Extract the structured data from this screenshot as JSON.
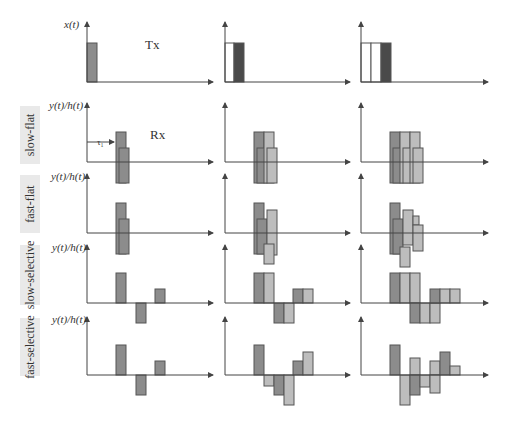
{
  "figure": {
    "tx_label": "Tx",
    "rx_label": "Rx",
    "tau_label": "τ₁",
    "x_axis_label": "x(t)",
    "y_axis_label": "y(t)/h(t)",
    "colors": {
      "axis": "#444444",
      "dark": "#8c8c8c",
      "darker": "#4a4a4a",
      "light": "#bdbdbd",
      "white": "#ffffff",
      "label_bg": "#e9e9e9",
      "outline": "#555555"
    }
  },
  "layout": {
    "col_axis_x": [
      87,
      225,
      361
    ],
    "col_axis_end": [
      213,
      350,
      488
    ],
    "rows": [
      {
        "name": "tx",
        "baseline": 82,
        "top": 22,
        "ylabel_key": "x_axis_label",
        "label": null
      },
      {
        "name": "slow-flat",
        "baseline": 162,
        "top": 103,
        "ylabel_key": "y_axis_label",
        "label": "slow-flat",
        "label_box": [
          20,
          106,
          58
        ]
      },
      {
        "name": "fast-flat",
        "baseline": 233,
        "top": 174,
        "ylabel_key": "y_axis_label",
        "label": "fast-flat",
        "label_box": [
          20,
          175,
          58
        ]
      },
      {
        "name": "slow-selective",
        "baseline": 303,
        "top": 245,
        "ylabel_key": "y_axis_label",
        "label": "slow-selective",
        "label_box": [
          20,
          245,
          60
        ]
      },
      {
        "name": "fast-selective",
        "baseline": 375,
        "top": 317,
        "ylabel_key": "y_axis_label",
        "label": "fast-selective",
        "label_box": [
          20,
          318,
          58
        ]
      }
    ]
  },
  "chart_data": {
    "type": "bar",
    "row_labels": [
      "slow-flat",
      "fast-flat",
      "slow-selective",
      "fast-selective"
    ],
    "columns": [
      "1 symbol",
      "2 symbols",
      "3 symbols"
    ],
    "note": "bars: [x_offset_px from y-axis, width_px, y_from_baseline (positive up), height_px, fill]",
    "panels": [
      [
        [
          [
            0,
            10,
            39,
            39,
            "dark"
          ]
        ],
        [
          [
            0,
            9,
            39,
            39,
            "white"
          ],
          [
            9,
            10,
            39,
            39,
            "darker"
          ]
        ],
        [
          [
            0,
            10,
            39,
            39,
            "white"
          ],
          [
            10,
            10,
            39,
            39,
            "white"
          ],
          [
            20,
            10,
            39,
            39,
            "darker"
          ]
        ]
      ],
      [
        [
          [
            29,
            10,
            30,
            51,
            "dark"
          ],
          [
            32,
            10,
            14,
            35,
            "dark"
          ]
        ],
        [
          [
            29,
            10,
            30,
            51,
            "dark"
          ],
          [
            32,
            10,
            14,
            35,
            "dark"
          ],
          [
            39,
            10,
            30,
            51,
            "light"
          ],
          [
            42,
            10,
            14,
            35,
            "light"
          ]
        ],
        [
          [
            29,
            10,
            30,
            51,
            "dark"
          ],
          [
            32,
            10,
            14,
            35,
            "dark"
          ],
          [
            39,
            10,
            30,
            51,
            "light"
          ],
          [
            42,
            10,
            14,
            35,
            "light"
          ],
          [
            49,
            10,
            30,
            51,
            "light"
          ],
          [
            52,
            10,
            14,
            35,
            "light"
          ]
        ]
      ],
      [
        [
          [
            29,
            10,
            30,
            51,
            "dark"
          ],
          [
            32,
            10,
            14,
            35,
            "dark"
          ]
        ],
        [
          [
            29,
            10,
            30,
            51,
            "dark"
          ],
          [
            32,
            10,
            14,
            35,
            "dark"
          ],
          [
            42,
            10,
            23,
            45,
            "light"
          ],
          [
            39,
            10,
            -11,
            20,
            "light"
          ]
        ],
        [
          [
            29,
            10,
            30,
            51,
            "dark"
          ],
          [
            32,
            10,
            14,
            35,
            "dark"
          ],
          [
            42,
            10,
            23,
            35,
            "light"
          ],
          [
            39,
            10,
            -14,
            20,
            "light"
          ],
          [
            52,
            6,
            17,
            9,
            "light"
          ],
          [
            52,
            10,
            8,
            26,
            "light"
          ]
        ]
      ],
      [
        [
          [
            29,
            10,
            30,
            30,
            "dark"
          ],
          [
            49,
            10,
            0,
            20,
            "dark"
          ],
          [
            68,
            10,
            14,
            14,
            "dark"
          ]
        ],
        [
          [
            29,
            10,
            30,
            30,
            "dark"
          ],
          [
            39,
            10,
            30,
            30,
            "light"
          ],
          [
            49,
            10,
            0,
            20,
            "dark"
          ],
          [
            59,
            10,
            0,
            20,
            "light"
          ],
          [
            68,
            10,
            14,
            14,
            "dark"
          ],
          [
            78,
            10,
            14,
            14,
            "light"
          ]
        ],
        [
          [
            29,
            10,
            30,
            30,
            "dark"
          ],
          [
            39,
            10,
            30,
            30,
            "light"
          ],
          [
            49,
            10,
            30,
            30,
            "light"
          ],
          [
            49,
            10,
            0,
            20,
            "dark"
          ],
          [
            59,
            10,
            0,
            20,
            "light"
          ],
          [
            69,
            10,
            0,
            20,
            "light"
          ],
          [
            69,
            10,
            14,
            14,
            "dark"
          ],
          [
            79,
            10,
            14,
            14,
            "light"
          ],
          [
            89,
            10,
            14,
            14,
            "light"
          ]
        ]
      ],
      [
        [
          [
            29,
            10,
            30,
            30,
            "dark"
          ],
          [
            49,
            10,
            0,
            20,
            "dark"
          ],
          [
            68,
            10,
            14,
            14,
            "dark"
          ]
        ],
        [
          [
            29,
            10,
            30,
            30,
            "dark"
          ],
          [
            39,
            10,
            0,
            11,
            "light"
          ],
          [
            49,
            10,
            0,
            20,
            "dark"
          ],
          [
            59,
            10,
            0,
            30,
            "light"
          ],
          [
            68,
            10,
            14,
            14,
            "dark"
          ],
          [
            78,
            10,
            23,
            23,
            "light"
          ]
        ],
        [
          [
            29,
            10,
            30,
            30,
            "dark"
          ],
          [
            39,
            10,
            0,
            30,
            "light"
          ],
          [
            49,
            10,
            17,
            17,
            "light"
          ],
          [
            49,
            10,
            0,
            20,
            "dark"
          ],
          [
            59,
            10,
            0,
            12,
            "light"
          ],
          [
            69,
            10,
            14,
            14,
            "light"
          ],
          [
            69,
            10,
            0,
            18,
            "light"
          ],
          [
            79,
            10,
            23,
            23,
            "dark"
          ],
          [
            89,
            10,
            9,
            9,
            "light"
          ]
        ]
      ]
    ]
  }
}
